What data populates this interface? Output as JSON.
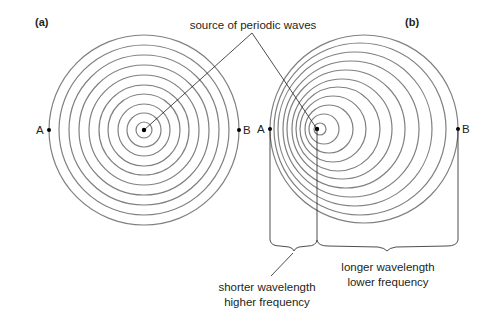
{
  "diagram": {
    "panel_a": {
      "label": "(a)",
      "source": {
        "x": 144,
        "y": 130
      },
      "circles": [
        {
          "cx": 144,
          "cy": 130,
          "r": 8
        },
        {
          "cx": 144,
          "cy": 130,
          "r": 17
        },
        {
          "cx": 144,
          "cy": 130,
          "r": 26
        },
        {
          "cx": 144,
          "cy": 130,
          "r": 36
        },
        {
          "cx": 144,
          "cy": 130,
          "r": 45
        },
        {
          "cx": 144,
          "cy": 130,
          "r": 55
        },
        {
          "cx": 144,
          "cy": 130,
          "r": 65
        },
        {
          "cx": 144,
          "cy": 130,
          "r": 75
        },
        {
          "cx": 144,
          "cy": 130,
          "r": 85
        },
        {
          "cx": 144,
          "cy": 130,
          "r": 95
        }
      ],
      "point_a": {
        "label": "A",
        "x": 49,
        "y": 130
      },
      "point_b": {
        "label": "B",
        "x": 239,
        "y": 130
      }
    },
    "panel_b": {
      "label": "(b)",
      "source": {
        "x": 317,
        "y": 129
      },
      "circles": [
        {
          "cx": 320,
          "cy": 129,
          "r": 6
        },
        {
          "cx": 324,
          "cy": 129,
          "r": 15
        },
        {
          "cx": 329,
          "cy": 129,
          "r": 24
        },
        {
          "cx": 333,
          "cy": 129,
          "r": 33
        },
        {
          "cx": 338,
          "cy": 129,
          "r": 42
        },
        {
          "cx": 342,
          "cy": 129,
          "r": 50
        },
        {
          "cx": 346,
          "cy": 129,
          "r": 59
        },
        {
          "cx": 351,
          "cy": 129,
          "r": 68
        },
        {
          "cx": 355,
          "cy": 129,
          "r": 77
        },
        {
          "cx": 360,
          "cy": 129,
          "r": 86
        },
        {
          "cx": 364,
          "cy": 129,
          "r": 94
        }
      ],
      "point_a": {
        "label": "A",
        "x": 270,
        "y": 129
      },
      "point_b": {
        "label": "B",
        "x": 458,
        "y": 129
      }
    },
    "source_label": "source of periodic waves",
    "short_label_1": "shorter wavelength",
    "short_label_2": "higher frequency",
    "long_label_1": "longer wavelength",
    "long_label_2": "lower frequency"
  }
}
